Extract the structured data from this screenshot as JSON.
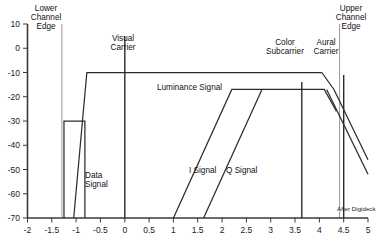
{
  "chart_data": {
    "type": "line",
    "title": "",
    "xlabel": "",
    "ylabel": "",
    "xlim": [
      -2,
      5
    ],
    "ylim": [
      -70,
      10
    ],
    "grid": false,
    "legend": "none",
    "x_ticks": [
      "-2",
      "-1.5",
      "-1",
      "-0.5",
      "0",
      "0.5",
      "1",
      "1.5",
      "2",
      "2.5",
      "3",
      "3.5",
      "4",
      "4.5",
      "5"
    ],
    "x_tick_values": [
      -2,
      -1.5,
      -1,
      -0.5,
      0,
      0.5,
      1,
      1.5,
      2,
      2.5,
      3,
      3.5,
      4,
      4.5,
      5
    ],
    "y_ticks": [
      "10",
      "0",
      "-10",
      "-20",
      "-30",
      "-40",
      "-50",
      "-60",
      "-70"
    ],
    "y_tick_values": [
      10,
      0,
      -10,
      -20,
      -30,
      -40,
      -50,
      -60,
      -70
    ],
    "series": [
      {
        "name": "Luminance Signal",
        "points": [
          [
            -1.05,
            -70
          ],
          [
            -0.78,
            -10
          ],
          [
            4.05,
            -10
          ],
          [
            4.3,
            -17
          ],
          [
            5.0,
            -46
          ]
        ]
      },
      {
        "name": "Luminance Signal Lower Skirt",
        "points": [
          [
            4.15,
            -17
          ],
          [
            5.0,
            -52
          ]
        ]
      },
      {
        "name": "Data Signal",
        "points": [
          [
            -1.25,
            -70
          ],
          [
            -1.25,
            -30
          ],
          [
            -0.82,
            -30
          ],
          [
            -0.82,
            -70
          ]
        ]
      },
      {
        "name": "I Signal",
        "points": [
          [
            1.0,
            -70
          ],
          [
            2.2,
            -17
          ],
          [
            4.1,
            -17
          ],
          [
            4.35,
            -26
          ]
        ]
      },
      {
        "name": "Q Signal",
        "points": [
          [
            1.62,
            -70
          ],
          [
            2.82,
            -17
          ]
        ]
      }
    ],
    "vertical_markers": [
      {
        "name": "Lower Channel Edge",
        "x": -1.25,
        "y_top": 10,
        "y_bottom": -70,
        "color": "#9a9a9a",
        "label": "Lower\nChannel\nEdge"
      },
      {
        "name": "Visual Carrier",
        "x": 0.0,
        "y_top": 5,
        "y_bottom": -70,
        "color": "#2c2c2c",
        "label": "Visual\nCarrier"
      },
      {
        "name": "Color Subcarrier",
        "x": 3.58,
        "y_top": -14,
        "y_bottom": -70,
        "color": "#2c2c2c",
        "label": "Color\nSubcarrier"
      },
      {
        "name": "Aural Carrier",
        "x": 4.5,
        "y_top": -11,
        "y_bottom": -70,
        "color": "#2c2c2c",
        "label": "Aural\nCarrier"
      },
      {
        "name": "Upper Channel Edge",
        "x": 4.75,
        "y_top": 10,
        "y_bottom": -70,
        "color": "#9a9a9a",
        "label": "Upper\nChannel\nEdge"
      }
    ],
    "annotations": [
      {
        "name": "lower-channel-edge-label",
        "text_lines": [
          "Lower",
          "Channel",
          "Edge"
        ],
        "x_px": 46,
        "y_px": 4
      },
      {
        "name": "visual-carrier-label",
        "text_lines": [
          "Visual",
          "Carrier"
        ],
        "x_px": 118,
        "y_px": 34
      },
      {
        "name": "color-subcarrier-label",
        "text_lines": [
          "Color",
          "Subcarrier"
        ],
        "x_px": 285,
        "y_px": 34
      },
      {
        "name": "aural-carrier-label",
        "text_lines": [
          "Aural",
          "Carrier"
        ],
        "x_px": 326,
        "y_px": 34
      },
      {
        "name": "upper-channel-edge-label",
        "text_lines": [
          "Upper",
          "Channel",
          "Edge"
        ],
        "x_px": 351,
        "y_px": 4
      },
      {
        "name": "luminance-signal-label",
        "text_lines": [
          "Luminance Signal"
        ],
        "x_px": 157,
        "y_px": 87
      },
      {
        "name": "data-signal-label",
        "text_lines": [
          "Data",
          "Signal"
        ],
        "x_px": 85,
        "y_px": 175
      },
      {
        "name": "i-signal-label",
        "text_lines": [
          "I Signal"
        ],
        "x_px": 189,
        "y_px": 170
      },
      {
        "name": "q-signal-label",
        "text_lines": [
          "Q Signal"
        ],
        "x_px": 226,
        "y_px": 170
      },
      {
        "name": "after-digideck-label",
        "text_lines": [
          "After Digideck"
        ],
        "x_px": 337,
        "y_px": 208
      }
    ]
  },
  "labels": {
    "lower_channel_edge_1": "Lower",
    "lower_channel_edge_2": "Channel",
    "lower_channel_edge_3": "Edge",
    "visual_carrier_1": "Visual",
    "visual_carrier_2": "Carrier",
    "color_subcarrier_1": "Color",
    "color_subcarrier_2": "Subcarrier",
    "aural_carrier_1": "Aural",
    "aural_carrier_2": "Carrier",
    "upper_channel_edge_1": "Upper",
    "upper_channel_edge_2": "Channel",
    "upper_channel_edge_3": "Edge",
    "luminance_signal": "Luminance Signal",
    "data_signal_1": "Data",
    "data_signal_2": "Signal",
    "i_signal": "I Signal",
    "q_signal": "Q Signal",
    "after_digideck": "After Digideck"
  },
  "colors": {
    "axis": "#3a3a3a",
    "curve": "#2c2c2c",
    "channel_edge": "#9a9a9a",
    "text": "#111111",
    "background": "#ffffff"
  }
}
